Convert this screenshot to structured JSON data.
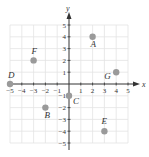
{
  "chart_data": {
    "type": "scatter",
    "title": "",
    "xlabel": "x",
    "ylabel": "y",
    "xlim": [
      -5,
      5
    ],
    "ylim": [
      -5,
      5
    ],
    "grid": true,
    "x_ticks": [
      "-5",
      "-4",
      "-3",
      "-2",
      "-1",
      "1",
      "2",
      "3",
      "4",
      "5"
    ],
    "y_ticks": [
      "5",
      "4",
      "3",
      "2",
      "1",
      "-1",
      "-2",
      "-3",
      "-4",
      "-5"
    ],
    "points": [
      {
        "label": "A",
        "x": 2,
        "y": 4
      },
      {
        "label": "B",
        "x": -2,
        "y": -2
      },
      {
        "label": "C",
        "x": 0,
        "y": -1
      },
      {
        "label": "D",
        "x": -5,
        "y": 0
      },
      {
        "label": "E",
        "x": 3,
        "y": -4
      },
      {
        "label": "F",
        "x": -3,
        "y": 2
      },
      {
        "label": "G",
        "x": 4,
        "y": 1
      }
    ]
  },
  "colors": {
    "axis": "#333333",
    "grid": "#e3e3e3",
    "point": "#9a9a9a",
    "text": "#333333"
  }
}
